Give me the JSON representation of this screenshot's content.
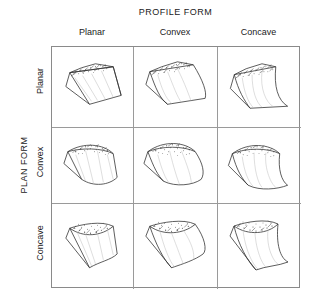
{
  "figure": {
    "kind": "classification-matrix",
    "column_axis_title": "PROFILE FORM",
    "row_axis_title": "PLAN FORM",
    "column_headers": [
      "Planar",
      "Convex",
      "Concave"
    ],
    "row_headers": [
      "Planar",
      "Convex",
      "Concave"
    ],
    "cells": [
      {
        "row": "Planar",
        "column": "Planar",
        "name": "planar-planar-block-diagram"
      },
      {
        "row": "Planar",
        "column": "Convex",
        "name": "planar-convex-block-diagram"
      },
      {
        "row": "Planar",
        "column": "Concave",
        "name": "planar-concave-block-diagram"
      },
      {
        "row": "Convex",
        "column": "Planar",
        "name": "convex-planar-block-diagram"
      },
      {
        "row": "Convex",
        "column": "Convex",
        "name": "convex-convex-block-diagram"
      },
      {
        "row": "Convex",
        "column": "Concave",
        "name": "convex-concave-block-diagram"
      },
      {
        "row": "Concave",
        "column": "Planar",
        "name": "concave-planar-block-diagram"
      },
      {
        "row": "Concave",
        "column": "Convex",
        "name": "concave-convex-block-diagram"
      },
      {
        "row": "Concave",
        "column": "Concave",
        "name": "concave-concave-block-diagram"
      }
    ],
    "colors": {
      "background": "#ffffff",
      "text": "#1a1a1a",
      "grid_line": "#8a8a8a",
      "drawing_line": "#333333",
      "stipple": "#4a4a4a"
    }
  }
}
